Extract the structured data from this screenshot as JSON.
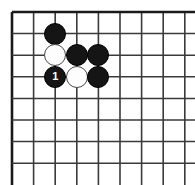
{
  "figure": {
    "kind": "go-board-diagram",
    "board_label": "",
    "background_color": "#ffffff",
    "line_color": "#3a3a3a",
    "edge_color": "#1a1a1a",
    "black_color": "#151515",
    "white_color": "#fdfdfd",
    "white_outline_color": "#4a4a4a"
  },
  "grid": {
    "origin_x": 12,
    "origin_y": 12,
    "pitch": 21.6,
    "vertical_lines": 9,
    "horizontal_lines": 8,
    "stone_radius": 11,
    "left_edge_is_board_border": true,
    "top_edge_is_board_border": true
  },
  "stones": [
    {
      "id": "stone-1",
      "color": "black",
      "col": 2,
      "row": 1,
      "label": ""
    },
    {
      "id": "stone-2",
      "color": "white",
      "col": 2,
      "row": 2,
      "label": ""
    },
    {
      "id": "stone-3",
      "color": "black",
      "col": 3,
      "row": 2,
      "label": ""
    },
    {
      "id": "stone-4",
      "color": "black",
      "col": 4,
      "row": 2,
      "label": ""
    },
    {
      "id": "stone-5",
      "color": "black",
      "col": 2,
      "row": 3,
      "label": "1"
    },
    {
      "id": "stone-6",
      "color": "white",
      "col": 3,
      "row": 3,
      "label": ""
    },
    {
      "id": "stone-7",
      "color": "black",
      "col": 4,
      "row": 3,
      "label": ""
    }
  ]
}
